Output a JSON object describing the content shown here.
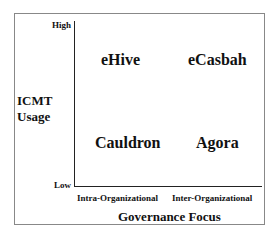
{
  "y_axis": {
    "title_line1": "ICMT",
    "title_line2": "Usage",
    "high": "High",
    "low": "Low"
  },
  "x_axis": {
    "title": "Governance Focus",
    "left": "Intra-Organizational",
    "right": "Inter-Organizational"
  },
  "quadrants": {
    "top_left": "eHive",
    "top_right": "eCasbah",
    "bottom_left": "Cauldron",
    "bottom_right": "Agora"
  }
}
